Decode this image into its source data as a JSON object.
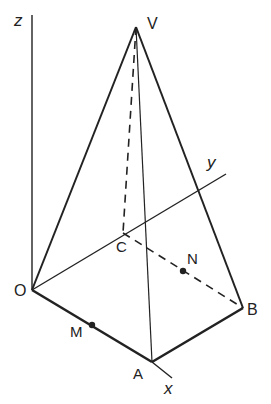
{
  "diagram": {
    "type": "3d-pyramid",
    "colors": {
      "line": "#222222",
      "background": "#ffffff"
    },
    "labels": {
      "z_axis": "z",
      "y_axis": "y",
      "x_axis": "x",
      "V": "V",
      "O": "O",
      "A": "A",
      "B": "B",
      "C": "C",
      "M": "M",
      "N": "N"
    },
    "points": {
      "V": [
        136,
        27
      ],
      "O": [
        32,
        290
      ],
      "A": [
        152,
        362
      ],
      "B": [
        243,
        308
      ],
      "C": [
        123,
        233
      ],
      "M": [
        92,
        325
      ],
      "N": [
        183,
        271
      ]
    },
    "edges": {
      "solid": [
        "OV",
        "VB",
        "VA",
        "OA",
        "AB",
        "OC(y-axis)"
      ],
      "dashed": [
        "VC",
        "CB"
      ]
    },
    "marked_points": [
      "M on OA",
      "N on CB"
    ]
  }
}
